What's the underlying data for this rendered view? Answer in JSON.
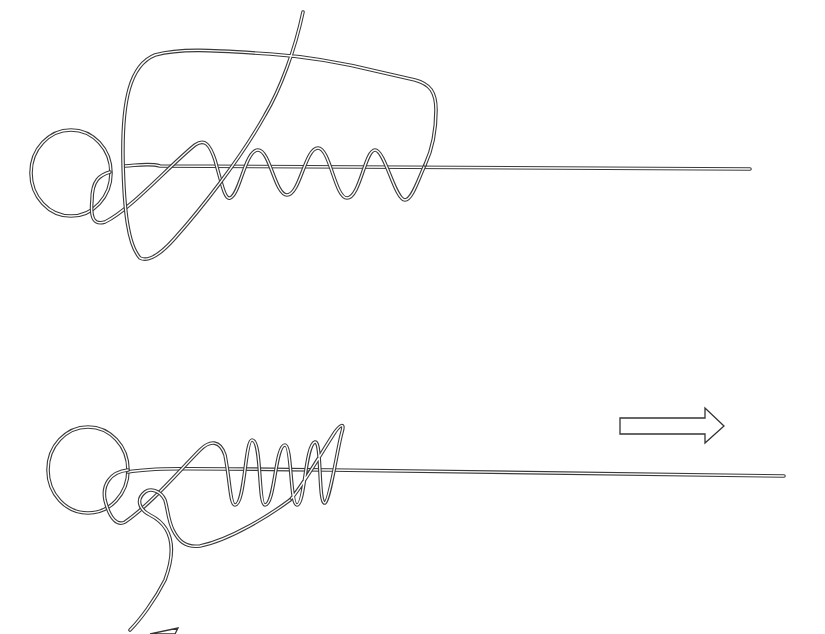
{
  "diagram": {
    "title": "",
    "stages": [
      {
        "id": "stage-1",
        "elements": [
          "ring-loop",
          "standing-line",
          "wraps",
          "large-return-loop",
          "tag-end"
        ],
        "wrap_count": 5
      },
      {
        "id": "stage-2",
        "elements": [
          "ring-loop",
          "standing-line",
          "tightened-wraps",
          "tag-end",
          "pull-arrow-right",
          "pull-arrow-left-partial"
        ],
        "wrap_count": 5,
        "arrow": "right"
      }
    ],
    "colors": {
      "line": "#3a3a3a",
      "background": "#ffffff"
    }
  }
}
